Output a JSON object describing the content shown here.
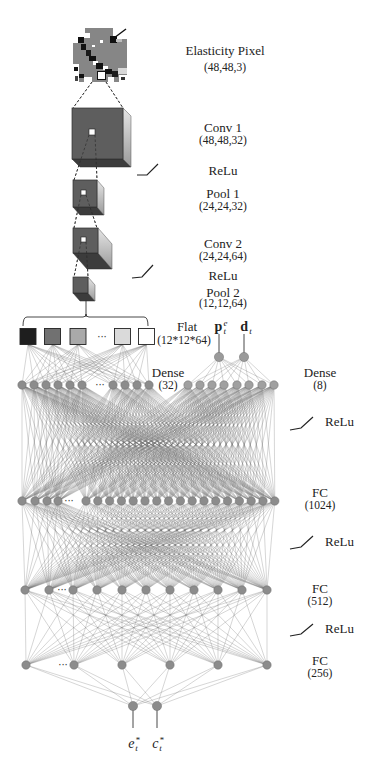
{
  "labels": {
    "elasticity_pixel": {
      "name": "Elasticity Pixel",
      "shape": "(48,48,3)"
    },
    "conv1": {
      "name": "Conv 1",
      "shape": "(48,48,32)"
    },
    "relu1": "ReLu",
    "pool1": {
      "name": "Pool 1",
      "shape": "(24,24,32)"
    },
    "conv2": {
      "name": "Conv 2",
      "shape": "(24,24,64)"
    },
    "relu2": "ReLu",
    "pool2": {
      "name": "Pool 2",
      "shape": "(12,12,64)"
    },
    "flat": {
      "name": "Flat",
      "shape": "(12*12*64)"
    },
    "dense32": {
      "name": "Dense",
      "size": "(32)"
    },
    "dense8": {
      "name": "Dense",
      "size": "(8)"
    },
    "relu3": "ReLu",
    "fc1024": {
      "name": "FC",
      "size": "(1024)"
    },
    "relu4": "ReLu",
    "fc512": {
      "name": "FC",
      "size": "(512)"
    },
    "relu5": "ReLu",
    "fc256": {
      "name": "FC",
      "size": "(256)"
    }
  },
  "inputs": [
    {
      "base": "p",
      "sup": "e",
      "sub": "t"
    },
    {
      "base": "d",
      "sup": "",
      "sub": "t"
    }
  ],
  "outputs": [
    {
      "base": "e",
      "sup": "*",
      "sub": "t"
    },
    {
      "base": "c",
      "sup": "*",
      "sub": "t"
    }
  ],
  "ellipsis": "···",
  "colors": {
    "node_fill": "#8c8c8c",
    "node_stroke": "#6e6e6e",
    "edge": "#6a6a6a",
    "cube_front": "#5e5e5e",
    "cube_bottom": "#3c3c3c",
    "cube_side_light": "#e4e4e4",
    "cube_side_dark": "#9c9c9c",
    "line": "#333333"
  },
  "diagram": {
    "elasticity_image": {
      "x": 73,
      "y": 28,
      "w": 54,
      "h": 54,
      "blocks": [
        [
          73,
          28,
          54,
          54,
          "#868686"
        ],
        [
          73,
          28,
          12,
          9,
          "#ffffff"
        ],
        [
          73,
          37,
          5,
          6,
          "#ffffff"
        ],
        [
          78,
          37,
          6,
          6,
          "#111111"
        ],
        [
          84,
          33,
          6,
          5,
          "#ffffff"
        ],
        [
          81,
          44,
          5,
          6,
          "#111111"
        ],
        [
          86,
          50,
          5,
          6,
          "#1a1a1a"
        ],
        [
          89,
          56,
          7,
          5,
          "#111111"
        ],
        [
          93,
          61,
          5,
          4,
          "#ffffff"
        ],
        [
          96,
          63,
          7,
          6,
          "#111111"
        ],
        [
          103,
          66,
          5,
          4,
          "#ffffff"
        ],
        [
          105,
          69,
          7,
          5,
          "#111111"
        ],
        [
          112,
          71,
          6,
          6,
          "#1c1c1c"
        ],
        [
          118,
          68,
          9,
          6,
          "#d8d8d8"
        ],
        [
          113,
          28,
          14,
          11,
          "#ffffff"
        ],
        [
          110,
          36,
          7,
          7,
          "#111111"
        ],
        [
          116,
          39,
          6,
          3,
          "#bdbdbd"
        ],
        [
          73,
          64,
          6,
          18,
          "#ffffff"
        ],
        [
          74,
          67,
          4,
          4,
          "#111111"
        ],
        [
          79,
          74,
          5,
          4,
          "#111111"
        ],
        [
          75,
          76,
          3,
          5,
          "#444444"
        ],
        [
          84,
          77,
          8,
          5,
          "#ffffff"
        ],
        [
          97,
          71,
          9,
          9,
          "#111111"
        ],
        [
          98,
          72,
          7,
          7,
          "#ffffff"
        ],
        [
          108,
          77,
          6,
          5,
          "#ffffff"
        ],
        [
          119,
          75,
          8,
          7,
          "#ffffff"
        ],
        [
          121,
          77,
          4,
          3,
          "#333333"
        ],
        [
          100,
          40,
          3,
          3,
          "#ffffff"
        ],
        [
          92,
          45,
          3,
          2,
          "#ffffff"
        ]
      ],
      "diagonal": [
        114,
        38,
        126,
        29
      ]
    },
    "cubes": [
      {
        "id": "conv1",
        "x": 72,
        "y": 108,
        "w": 51,
        "h": 51,
        "dx": 8,
        "dy": 8,
        "hole": [
          89,
          129,
          6
        ]
      },
      {
        "id": "pool1",
        "x": 73,
        "y": 180,
        "w": 24,
        "h": 27,
        "dx": 7,
        "dy": 8,
        "hole": [
          81,
          190,
          5
        ]
      },
      {
        "id": "conv2",
        "x": 73,
        "y": 228,
        "w": 25,
        "h": 25,
        "dx": 14,
        "dy": 16,
        "hole": [
          81,
          237,
          5
        ]
      },
      {
        "id": "pool2",
        "x": 73,
        "y": 277,
        "w": 15,
        "h": 16,
        "dx": 7,
        "dy": 8,
        "hole": null
      }
    ],
    "dashed_links": [
      [
        92,
        82,
        73,
        108
      ],
      [
        106,
        82,
        123,
        108
      ],
      [
        89,
        135,
        74,
        180
      ],
      [
        95,
        135,
        97,
        180
      ],
      [
        81,
        195,
        74,
        228
      ],
      [
        86,
        195,
        97,
        228
      ],
      [
        81,
        242,
        74,
        277
      ],
      [
        86,
        242,
        88,
        277
      ]
    ],
    "solid_lines": [
      [
        86,
        300,
        86,
        317
      ],
      [
        219,
        334,
        219,
        353
      ],
      [
        244,
        334,
        244,
        353
      ],
      [
        133,
        710,
        133,
        728
      ],
      [
        157,
        710,
        157,
        728
      ]
    ],
    "bracket": {
      "x1": 23,
      "x2": 148,
      "y": 317,
      "drop": 9,
      "cx": 86
    },
    "relu_icons": [
      [
        137,
        175,
        147,
        175,
        158,
        164
      ],
      [
        132,
        278,
        142,
        277,
        153,
        265
      ],
      [
        290,
        430,
        301,
        428,
        313,
        417
      ],
      [
        290,
        549,
        301,
        547,
        313,
        536
      ],
      [
        290,
        636,
        301,
        634,
        313,
        624
      ]
    ],
    "layers": [
      {
        "id": "flat",
        "type": "square",
        "y": 336.5,
        "size": 16,
        "xs": [
          28,
          52.5,
          78,
          122.5,
          146.5
        ],
        "fills": [
          "#1e1e1e",
          "#717171",
          "#a9a9a9",
          "#dadada",
          "#ffffff"
        ],
        "ellipsis_x": 102
      },
      {
        "id": "inputs",
        "type": "node",
        "y": 357,
        "r": 4.6,
        "xs": [
          219,
          244
        ],
        "fill": "#9a9a9a"
      },
      {
        "id": "dense32",
        "type": "node",
        "y": 385,
        "r": 4.2,
        "xs": [
          22,
          34,
          46,
          58,
          70,
          82,
          113,
          125,
          137,
          149
        ],
        "ellipsis_x": 100
      },
      {
        "id": "dense8",
        "type": "node",
        "y": 385,
        "r": 4.2,
        "fill": "#a0a0a0",
        "xs": [
          188,
          200,
          212,
          224,
          237,
          249,
          262,
          274
        ]
      },
      {
        "id": "fc1024",
        "type": "node",
        "y": 501,
        "r": 4.2,
        "xs": [
          22,
          35,
          47,
          58,
          86,
          97.8,
          109.6,
          121.4,
          133.2,
          145,
          156.8,
          168.6,
          180.4,
          192.2,
          204,
          215.8,
          227.6,
          239.4,
          251.2,
          263,
          274.8
        ],
        "ellipsis_x": 69
      },
      {
        "id": "fc512",
        "type": "node",
        "y": 590,
        "r": 4.2,
        "xs": [
          25,
          49,
          73,
          97,
          122,
          146,
          170,
          194,
          218,
          242,
          267
        ],
        "ellipsis_x": 62
      },
      {
        "id": "fc256",
        "type": "node",
        "y": 665,
        "r": 4.2,
        "xs": [
          26,
          74,
          122,
          170,
          218,
          267
        ],
        "ellipsis_x": 63
      },
      {
        "id": "outputs",
        "type": "node",
        "y": 706,
        "r": 4.6,
        "xs": [
          133,
          157
        ]
      }
    ],
    "connections": [
      [
        "flat",
        "dense32"
      ],
      [
        "inputs",
        "dense8"
      ],
      [
        "dense32",
        "fc1024"
      ],
      [
        "dense8",
        "fc1024"
      ],
      [
        "fc1024",
        "fc512"
      ],
      [
        "fc512",
        "fc256"
      ],
      [
        "fc256",
        "outputs"
      ]
    ]
  }
}
